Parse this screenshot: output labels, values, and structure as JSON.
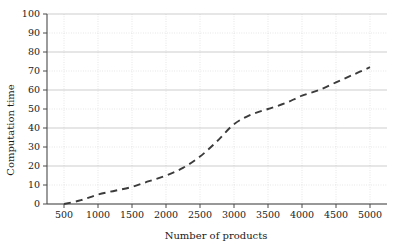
{
  "chart_data": {
    "type": "line",
    "title": "",
    "xlabel": "Number of products",
    "ylabel": "Computation time",
    "xlim": [
      250,
      5250
    ],
    "ylim": [
      0,
      100
    ],
    "grid": true,
    "legend": false,
    "line_style": "dashed",
    "line_color": "#3b3b3b",
    "x_ticks": [
      500,
      1000,
      1500,
      2000,
      2500,
      3000,
      3500,
      4000,
      4500,
      5000
    ],
    "y_ticks": [
      0,
      10,
      20,
      30,
      40,
      50,
      60,
      70,
      80,
      90,
      100
    ],
    "x_tick_labels": [
      "500",
      "1000",
      "1500",
      "2000",
      "2500",
      "3000",
      "3500",
      "4000",
      "4500",
      "5000"
    ],
    "y_tick_labels": [
      "0",
      "10",
      "20",
      "30",
      "40",
      "50",
      "60",
      "70",
      "80",
      "90",
      "100"
    ],
    "x": [
      500,
      750,
      1000,
      1250,
      1500,
      1750,
      2000,
      2250,
      2500,
      2750,
      3000,
      3250,
      3500,
      3750,
      4000,
      4250,
      4500,
      4750,
      5000
    ],
    "y": [
      0,
      2,
      5,
      7,
      9,
      12,
      15,
      19,
      25,
      33,
      42,
      47,
      50,
      53,
      57,
      60,
      64,
      68,
      72
    ],
    "series": [
      {
        "name": "Computation time",
        "x": [
          500,
          750,
          1000,
          1250,
          1500,
          1750,
          2000,
          2250,
          2500,
          2750,
          3000,
          3250,
          3500,
          3750,
          4000,
          4250,
          4500,
          4750,
          5000
        ],
        "values": [
          0,
          2,
          5,
          7,
          9,
          12,
          15,
          19,
          25,
          33,
          42,
          47,
          50,
          53,
          57,
          60,
          64,
          68,
          72
        ]
      }
    ]
  },
  "colors": {
    "background": "#ffffff",
    "axis": "#4a4a4a",
    "grid_major": "#b8b8b8",
    "grid_minor": "#cccccc",
    "curve": "#3b3b3b",
    "text": "#1a1a1a"
  }
}
